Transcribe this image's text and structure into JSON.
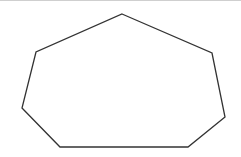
{
  "diagram": {
    "shape": "heptagon",
    "stroke_color": "#333333",
    "fill_color": "none",
    "stroke_width": 1.3,
    "vertices": [
      [
        122,
        14
      ],
      [
        212,
        53
      ],
      [
        225,
        117
      ],
      [
        188,
        147
      ],
      [
        60,
        147
      ],
      [
        22,
        108
      ],
      [
        36,
        52
      ]
    ]
  },
  "colors": {
    "background": "#ffffff",
    "top_rule": "#cfcfcf"
  }
}
